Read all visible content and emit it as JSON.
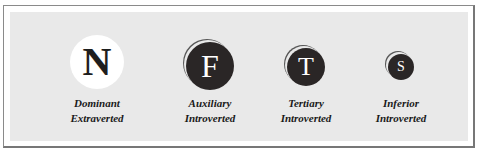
{
  "diagram": {
    "functions": [
      {
        "letter": "N",
        "role": "Dominant",
        "attitude": "Extraverted",
        "style": "light",
        "cx": 97,
        "cy": 62,
        "size": 54,
        "font": 40
      },
      {
        "letter": "F",
        "role": "Auxiliary",
        "attitude": "Introverted",
        "style": "dark",
        "cx": 210,
        "cy": 66,
        "size": 48,
        "font": 32
      },
      {
        "letter": "T",
        "role": "Tertiary",
        "attitude": "Introverted",
        "style": "dark",
        "cx": 306,
        "cy": 67,
        "size": 38,
        "font": 26
      },
      {
        "letter": "S",
        "role": "Inferior",
        "attitude": "Introverted",
        "style": "dark",
        "cx": 401,
        "cy": 67,
        "size": 26,
        "font": 14
      }
    ],
    "colors": {
      "panel_background": "#e9e9e9",
      "dark_circle": "#2a2626",
      "light_circle": "#ffffff",
      "label_text": "#1a1a1a"
    }
  }
}
